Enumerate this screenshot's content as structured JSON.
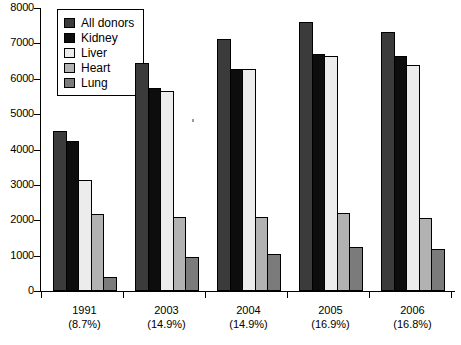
{
  "chart_data": {
    "type": "bar",
    "title": "",
    "subtitle": "",
    "xlabel": "",
    "ylabel": "",
    "ylim": [
      0,
      8000
    ],
    "ytick_step": 1000,
    "yticks": [
      "0",
      "1000",
      "2000",
      "3000",
      "4000",
      "5000",
      "6000",
      "7000",
      "8000"
    ],
    "grid": false,
    "legend_position": "top-left",
    "categories": [
      "1991",
      "2003",
      "2004",
      "2005",
      "2006"
    ],
    "category_sublabels": [
      "(8.7%)",
      "(14.9%)",
      "(14.9%)",
      "(16.9%)",
      "(16.8%)"
    ],
    "series": [
      {
        "name": "All donors",
        "color": "#3b3b3b",
        "values": [
          4530,
          6450,
          7120,
          7600,
          7320
        ]
      },
      {
        "name": "Kidney",
        "color": "#0d0d0d",
        "values": [
          4230,
          5750,
          6270,
          6700,
          6650
        ]
      },
      {
        "name": "Liver",
        "color": "#ececec",
        "values": [
          3150,
          5650,
          6290,
          6650,
          6400
        ]
      },
      {
        "name": "Heart",
        "color": "#b2b2b2",
        "values": [
          2180,
          2080,
          2080,
          2200,
          2060
        ]
      },
      {
        "name": "Lung",
        "color": "#7b7b7b",
        "values": [
          400,
          950,
          1050,
          1250,
          1200
        ]
      }
    ]
  },
  "legend": {
    "items": [
      {
        "label": "All donors"
      },
      {
        "label": "Kidney"
      },
      {
        "label": "Liver"
      },
      {
        "label": "Heart"
      },
      {
        "label": "Lung"
      }
    ]
  }
}
